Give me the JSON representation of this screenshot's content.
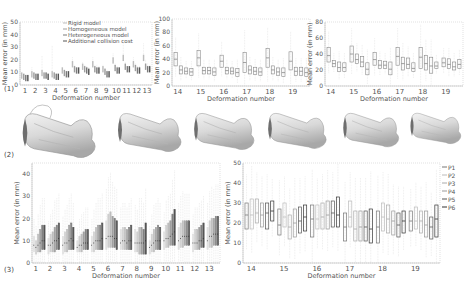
{
  "figure": {
    "panel_labels": [
      "(1)",
      "(2)",
      "(3)"
    ]
  },
  "chart_data": [
    {
      "id": "panel1a",
      "type": "box",
      "xlabel": "Deformation number",
      "ylabel": "Mean error (in mm)",
      "ylim": [
        0,
        50
      ],
      "yticks": [
        0,
        10,
        20,
        30,
        40,
        50
      ],
      "categories": [
        "1",
        "2",
        "3",
        "4",
        "5",
        "6",
        "7",
        "8",
        "9",
        "10",
        "11",
        "12",
        "13"
      ],
      "legend": [
        "Rigid model",
        "Homogeneous model",
        "Heterogeneous model",
        "Additional collision cost"
      ],
      "series_colors": [
        "#bdbdbd",
        "#9e9e9e",
        "#7a7a7a",
        "#555555"
      ],
      "medians": [
        [
          8,
          7,
          6,
          6
        ],
        [
          9,
          8,
          7,
          7
        ],
        [
          10,
          8,
          8,
          7
        ],
        [
          9,
          8,
          7,
          7
        ],
        [
          12,
          10,
          9,
          9
        ],
        [
          17,
          13,
          12,
          12
        ],
        [
          15,
          13,
          12,
          11
        ],
        [
          17,
          13,
          12,
          12
        ],
        [
          13,
          11,
          9,
          9
        ],
        [
          20,
          14,
          12,
          12
        ],
        [
          22,
          15,
          13,
          13
        ],
        [
          17,
          14,
          12,
          12
        ],
        [
          22,
          15,
          13,
          13
        ]
      ],
      "maxima": [
        [
          9,
          8,
          8,
          7
        ],
        [
          14,
          9,
          9,
          8
        ],
        [
          23,
          10,
          9,
          9
        ],
        [
          31,
          10,
          9,
          9
        ],
        [
          14,
          12,
          11,
          11
        ],
        [
          22,
          16,
          14,
          14
        ],
        [
          18,
          16,
          15,
          14
        ],
        [
          22,
          16,
          16,
          15
        ],
        [
          16,
          13,
          12,
          11
        ],
        [
          25,
          17,
          15,
          14
        ],
        [
          33,
          18,
          15,
          15
        ],
        [
          22,
          17,
          15,
          15
        ],
        [
          33,
          20,
          17,
          16
        ]
      ]
    },
    {
      "id": "panel1b",
      "type": "box",
      "xlabel": "Deformation number",
      "ylabel": "Mean error (in mm)",
      "ylim": [
        0,
        100
      ],
      "yticks": [
        0,
        20,
        40,
        60,
        80,
        100
      ],
      "categories": [
        "14",
        "15",
        "16",
        "17",
        "18",
        "19"
      ],
      "boxes_per_group": 4,
      "boxes": [
        [
          [
            30,
            50,
            40
          ],
          [
            18,
            30,
            24
          ],
          [
            18,
            27,
            22
          ],
          [
            16,
            26,
            21
          ]
        ],
        [
          [
            30,
            53,
            42
          ],
          [
            18,
            28,
            23
          ],
          [
            18,
            28,
            23
          ],
          [
            16,
            27,
            21
          ]
        ],
        [
          [
            28,
            46,
            37
          ],
          [
            18,
            28,
            23
          ],
          [
            18,
            27,
            22
          ],
          [
            14,
            26,
            20
          ]
        ],
        [
          [
            20,
            50,
            35
          ],
          [
            18,
            30,
            24
          ],
          [
            17,
            28,
            22
          ],
          [
            16,
            27,
            21
          ]
        ],
        [
          [
            28,
            56,
            42
          ],
          [
            18,
            30,
            24
          ],
          [
            16,
            27,
            21
          ],
          [
            14,
            27,
            20
          ]
        ],
        [
          [
            24,
            51,
            37
          ],
          [
            16,
            28,
            22
          ],
          [
            16,
            28,
            22
          ],
          [
            14,
            27,
            20
          ]
        ]
      ]
    },
    {
      "id": "panel1c",
      "type": "box",
      "xlabel": "Deformation number",
      "ylabel": "Mean error (in mm)",
      "ylim": [
        0,
        80
      ],
      "yticks": [
        0,
        20,
        40,
        60,
        80
      ],
      "categories": [
        "14",
        "15",
        "16",
        "17",
        "18",
        "19"
      ],
      "boxes_per_group": 4,
      "boxes": [
        [
          [
            30,
            48,
            38
          ],
          [
            24,
            32,
            28
          ],
          [
            18,
            30,
            23
          ],
          [
            18,
            29,
            23
          ]
        ],
        [
          [
            30,
            50,
            40
          ],
          [
            28,
            40,
            33
          ],
          [
            24,
            37,
            30
          ],
          [
            14,
            29,
            21
          ]
        ],
        [
          [
            26,
            42,
            33
          ],
          [
            22,
            32,
            26
          ],
          [
            22,
            31,
            26
          ],
          [
            14,
            30,
            21
          ]
        ],
        [
          [
            26,
            48,
            37
          ],
          [
            20,
            36,
            28
          ],
          [
            22,
            35,
            27
          ],
          [
            18,
            29,
            22
          ]
        ],
        [
          [
            22,
            48,
            36
          ],
          [
            20,
            38,
            28
          ],
          [
            16,
            36,
            25
          ],
          [
            22,
            30,
            25
          ]
        ],
        [
          [
            24,
            35,
            29
          ],
          [
            22,
            34,
            27
          ],
          [
            20,
            30,
            24
          ],
          [
            22,
            33,
            27
          ]
        ]
      ]
    },
    {
      "id": "panel3a",
      "type": "box",
      "xlabel": "Deformation number",
      "ylabel": "Mean error (in mm)",
      "ylim": [
        0,
        45
      ],
      "yticks": [
        0,
        10,
        20,
        30,
        40
      ],
      "categories": [
        "1",
        "2",
        "3",
        "4",
        "5",
        "6",
        "7",
        "8",
        "9",
        "10",
        "11",
        "12",
        "13"
      ],
      "boxes_per_group": 6,
      "series_colors": [
        "#e0e0e0",
        "#cfcfcf",
        "#bdbdbd",
        "#a0a0a0",
        "#808080",
        "#555555"
      ],
      "boxes": [
        [
          [
            5,
            12,
            8
          ],
          [
            4,
            10,
            7
          ],
          [
            5,
            13,
            8
          ],
          [
            5,
            15,
            9
          ],
          [
            6,
            17,
            10
          ],
          [
            6,
            17,
            10
          ]
        ],
        [
          [
            4,
            11,
            8
          ],
          [
            5,
            13,
            8
          ],
          [
            5,
            14,
            9
          ],
          [
            5,
            16,
            10
          ],
          [
            6,
            17,
            10
          ],
          [
            6,
            18,
            11
          ]
        ],
        [
          [
            4,
            12,
            8
          ],
          [
            5,
            14,
            9
          ],
          [
            5,
            15,
            9
          ],
          [
            6,
            17,
            10
          ],
          [
            6,
            18,
            11
          ],
          [
            6,
            16,
            10
          ]
        ],
        [
          [
            5,
            10,
            7
          ],
          [
            5,
            12,
            8
          ],
          [
            5,
            13,
            8
          ],
          [
            6,
            14,
            9
          ],
          [
            6,
            15,
            9
          ],
          [
            6,
            15,
            9
          ]
        ],
        [
          [
            5,
            12,
            8
          ],
          [
            5,
            14,
            9
          ],
          [
            6,
            16,
            10
          ],
          [
            6,
            17,
            10
          ],
          [
            6,
            17,
            10
          ],
          [
            6,
            18,
            11
          ]
        ],
        [
          [
            6,
            19,
            11
          ],
          [
            7,
            22,
            12
          ],
          [
            7,
            23,
            12
          ],
          [
            7,
            21,
            12
          ],
          [
            7,
            20,
            11
          ],
          [
            6,
            19,
            11
          ]
        ],
        [
          [
            6,
            15,
            9
          ],
          [
            6,
            16,
            10
          ],
          [
            6,
            16,
            10
          ],
          [
            6,
            15,
            9
          ],
          [
            6,
            16,
            10
          ],
          [
            6,
            17,
            10
          ]
        ],
        [
          [
            5,
            15,
            9
          ],
          [
            5,
            14,
            9
          ],
          [
            4,
            16,
            9
          ],
          [
            4,
            16,
            9
          ],
          [
            4,
            15,
            9
          ],
          [
            4,
            18,
            10
          ]
        ],
        [
          [
            4,
            10,
            7
          ],
          [
            5,
            13,
            8
          ],
          [
            5,
            15,
            9
          ],
          [
            6,
            16,
            10
          ],
          [
            6,
            17,
            10
          ],
          [
            6,
            16,
            10
          ]
        ],
        [
          [
            6,
            14,
            10
          ],
          [
            7,
            17,
            11
          ],
          [
            7,
            18,
            11
          ],
          [
            8,
            19,
            12
          ],
          [
            8,
            22,
            13
          ],
          [
            8,
            24,
            14
          ]
        ],
        [
          [
            6,
            16,
            10
          ],
          [
            7,
            18,
            11
          ],
          [
            7,
            19,
            12
          ],
          [
            8,
            19,
            12
          ],
          [
            8,
            19,
            12
          ],
          [
            8,
            19,
            12
          ]
        ],
        [
          [
            5,
            13,
            9
          ],
          [
            6,
            15,
            9
          ],
          [
            6,
            15,
            9
          ],
          [
            6,
            16,
            10
          ],
          [
            7,
            17,
            10
          ],
          [
            7,
            18,
            11
          ]
        ],
        [
          [
            6,
            16,
            10
          ],
          [
            7,
            19,
            12
          ],
          [
            7,
            20,
            12
          ],
          [
            8,
            20,
            13
          ],
          [
            8,
            21,
            13
          ],
          [
            8,
            21,
            13
          ]
        ]
      ]
    },
    {
      "id": "panel3b",
      "type": "box",
      "xlabel": "Deformation number",
      "ylabel": "Mean error (in mm)",
      "ylim": [
        0,
        50
      ],
      "yticks": [
        0,
        10,
        20,
        30,
        40,
        50
      ],
      "categories": [
        "14",
        "15",
        "16",
        "17",
        "18",
        "19"
      ],
      "legend": [
        "P1",
        "P2",
        "P3",
        "P4",
        "P5",
        "P6"
      ],
      "boxes_per_group": 6,
      "series_colors": [
        "#777777",
        "#bbbbbb",
        "#aaaaaa",
        "#999999",
        "#555555",
        "#333333"
      ],
      "boxes": [
        [
          [
            17,
            30,
            24
          ],
          [
            17,
            32,
            24
          ],
          [
            20,
            32,
            25
          ],
          [
            18,
            30,
            24
          ],
          [
            17,
            30,
            25
          ],
          [
            21,
            31,
            26
          ]
        ],
        [
          [
            14,
            27,
            19
          ],
          [
            18,
            30,
            23
          ],
          [
            12,
            24,
            18
          ],
          [
            13,
            27,
            20
          ],
          [
            15,
            28,
            21
          ],
          [
            16,
            29,
            23
          ]
        ],
        [
          [
            13,
            29,
            22
          ],
          [
            17,
            29,
            22
          ],
          [
            17,
            30,
            23
          ],
          [
            17,
            31,
            24
          ],
          [
            18,
            31,
            25
          ],
          [
            18,
            33,
            24
          ]
        ],
        [
          [
            11,
            25,
            18
          ],
          [
            18,
            31,
            23
          ],
          [
            11,
            26,
            17
          ],
          [
            11,
            26,
            18
          ],
          [
            11,
            26,
            18
          ],
          [
            10,
            27,
            17
          ]
        ],
        [
          [
            10,
            26,
            18
          ],
          [
            16,
            30,
            23
          ],
          [
            15,
            29,
            22
          ],
          [
            14,
            26,
            21
          ],
          [
            13,
            25,
            19
          ],
          [
            15,
            26,
            21
          ]
        ],
        [
          [
            16,
            26,
            21
          ],
          [
            17,
            28,
            21
          ],
          [
            15,
            26,
            21
          ],
          [
            13,
            26,
            19
          ],
          [
            12,
            23,
            18
          ],
          [
            13,
            29,
            22
          ]
        ]
      ]
    }
  ]
}
